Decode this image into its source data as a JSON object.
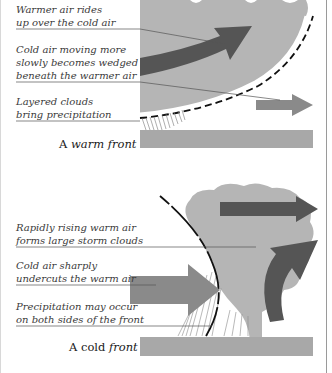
{
  "warm_front": {
    "title_prefix": "A ",
    "title_emph": "warm front",
    "labels": [
      {
        "line1": "Warmer air rides",
        "line2": "up over the cold air"
      },
      {
        "line1": "Cold air moving more",
        "line2": "slowly becomes wedged",
        "line3": "beneath the warmer air"
      },
      {
        "line1": "Layered clouds",
        "line2": "bring precipitation"
      }
    ]
  },
  "cold_front": {
    "title_prefix": "A cold ",
    "title_emph": "front",
    "labels": [
      {
        "line1": "Rapidly rising warm air",
        "line2": "forms large storm clouds"
      },
      {
        "line1": "Cold air sharply",
        "line2": "undercuts the warm air"
      },
      {
        "line1": "Precipitation may occur",
        "line2": "on both sides of the front"
      }
    ]
  },
  "colors": {
    "cloud": "#b5b5b5",
    "warm_arrow": "#555555",
    "cold_arrow": "#8a8a8a",
    "ground": "#a8a8a8",
    "front_line": "#111111",
    "leader_line": "#555555"
  }
}
